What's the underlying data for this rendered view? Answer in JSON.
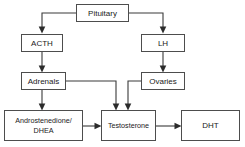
{
  "diagram": {
    "background_color": "#ffffff",
    "box_fill": "#ffffff",
    "box_stroke": "#4d4d4d",
    "line_color": "#3a3a3a",
    "text_color": "#1a1a1a",
    "nodes": [
      {
        "id": "pituitary",
        "label": "Pituitary"
      },
      {
        "id": "acth",
        "label": "ACTH"
      },
      {
        "id": "lh",
        "label": "LH"
      },
      {
        "id": "adrenals",
        "label": "Adrenals"
      },
      {
        "id": "ovaries",
        "label": "Ovaries"
      },
      {
        "id": "androstenedione",
        "label_line1": "Androstenedione/",
        "label_line2": "DHEA"
      },
      {
        "id": "testosterone",
        "label": "Testosterone"
      },
      {
        "id": "dht",
        "label": "DHT"
      }
    ],
    "edges": [
      {
        "from": "pituitary",
        "to": "acth"
      },
      {
        "from": "pituitary",
        "to": "lh"
      },
      {
        "from": "acth",
        "to": "adrenals"
      },
      {
        "from": "lh",
        "to": "ovaries"
      },
      {
        "from": "adrenals",
        "to": "androstenedione"
      },
      {
        "from": "adrenals",
        "to": "testosterone"
      },
      {
        "from": "ovaries",
        "to": "testosterone"
      },
      {
        "from": "androstenedione",
        "to": "testosterone"
      },
      {
        "from": "testosterone",
        "to": "dht"
      }
    ]
  }
}
